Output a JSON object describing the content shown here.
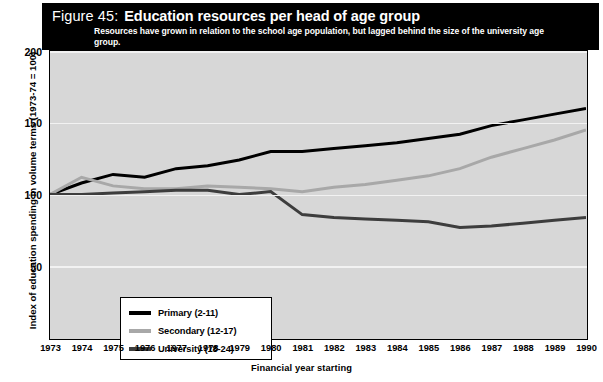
{
  "figure": {
    "number": "Figure 45:",
    "title": "Education resources per head of age group",
    "subtitle": "Resources have grown in relation to the school age population, but lagged behind the size of the university age group."
  },
  "colors": {
    "header_background": "#000000",
    "header_text": "#ffffff",
    "plot_background": "#d7d7d7",
    "gridline": "#f2f2f2",
    "primary": "#000000",
    "secondary": "#a8a8a8",
    "university": "#3d3d3d",
    "legend_background": "#ffffff",
    "axis": "#000000"
  },
  "legend": {
    "position": "inside-bottom-left",
    "entries": [
      {
        "label": "Primary (2-11)",
        "color": "#000000"
      },
      {
        "label": "Secondary (12-17)",
        "color": "#a8a8a8"
      },
      {
        "label": "University (18-24)",
        "color": "#3d3d3d"
      }
    ]
  },
  "chart_data": {
    "type": "line",
    "title": "Education resources per head of age group",
    "subtitle": "Resources have grown in relation to the school age population, but lagged behind the size of the university age group.",
    "xlabel": "Financial year starting",
    "ylabel": "Index of education spending in volume terms (1973-74 = 100)",
    "grid": true,
    "legend_position": "inside-bottom-left",
    "xlim": [
      1973,
      1990
    ],
    "ylim": [
      0,
      200
    ],
    "yticks": [
      50,
      100,
      150,
      200
    ],
    "xticks": [
      1973,
      1974,
      1975,
      1976,
      1977,
      1978,
      1979,
      1980,
      1981,
      1982,
      1983,
      1984,
      1985,
      1986,
      1987,
      1988,
      1989,
      1990
    ],
    "categories": [
      1973,
      1974,
      1975,
      1976,
      1977,
      1978,
      1979,
      1980,
      1981,
      1982,
      1983,
      1984,
      1985,
      1986,
      1987,
      1988,
      1989,
      1990
    ],
    "series": [
      {
        "name": "Primary (2-11)",
        "color": "#000000",
        "values": [
          100,
          108,
          114,
          112,
          118,
          120,
          124,
          130,
          130,
          132,
          134,
          136,
          139,
          142,
          148,
          152,
          156,
          160
        ]
      },
      {
        "name": "Secondary (12-17)",
        "color": "#a8a8a8",
        "values": [
          100,
          112,
          106,
          104,
          104,
          106,
          105,
          104,
          102,
          105,
          107,
          110,
          113,
          118,
          126,
          132,
          138,
          145
        ]
      },
      {
        "name": "University (18-24)",
        "color": "#3d3d3d",
        "values": [
          100,
          100,
          101,
          102,
          103,
          103,
          100,
          102,
          86,
          84,
          83,
          82,
          81,
          77,
          78,
          80,
          82,
          84
        ]
      }
    ]
  }
}
